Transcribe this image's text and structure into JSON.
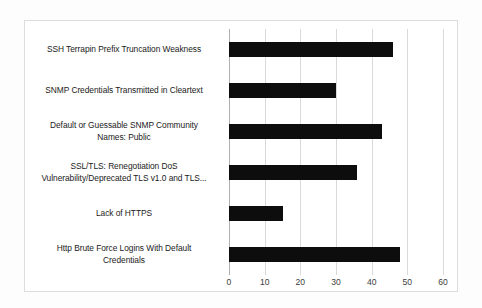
{
  "chart_data": {
    "type": "bar",
    "orientation": "horizontal",
    "title": "",
    "subtitle": "",
    "xlabel": "",
    "ylabel": "",
    "xlim": [
      0,
      60
    ],
    "xticks": [
      "0",
      "10",
      "20",
      "30",
      "40",
      "50",
      "60"
    ],
    "xtick_values": [
      0,
      10,
      20,
      30,
      40,
      50,
      60
    ],
    "grid": true,
    "legend": false,
    "bar_color": "#0d0d0d",
    "categories": [
      "SSH Terrapin Prefix Truncation Weakness",
      "SNMP Credentials Transmitted in Cleartext",
      "Default or Guessable SNMP Community Names: Public",
      "SSL/TLS: Renegotiation DoS Vulnerability/Deprecated TLS v1.0 and TLS...",
      "Lack of HTTPS",
      "Http Brute Force Logins With Default Credentials"
    ],
    "category_lines": [
      [
        "SSH Terrapin Prefix Truncation Weakness"
      ],
      [
        "SNMP Credentials Transmitted in Cleartext"
      ],
      [
        "Default or Guessable SNMP Community",
        "Names: Public"
      ],
      [
        "SSL/TLS: Renegotiation DoS",
        "Vulnerability/Deprecated TLS v1.0 and TLS..."
      ],
      [
        "Lack of HTTPS"
      ],
      [
        "Http Brute Force Logins With Default",
        "Credentials"
      ]
    ],
    "values": [
      46,
      30,
      43,
      36,
      15,
      48
    ]
  }
}
